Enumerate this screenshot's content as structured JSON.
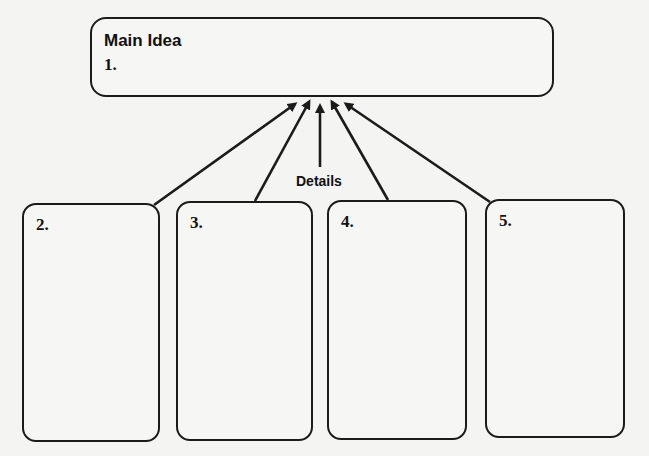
{
  "main_idea": {
    "title": "Main Idea",
    "number": "1."
  },
  "connector_label": "Details",
  "detail_boxes": [
    {
      "number": "2."
    },
    {
      "number": "3."
    },
    {
      "number": "4."
    },
    {
      "number": "5."
    }
  ],
  "colors": {
    "stroke": "#1b1b1b",
    "background": "#f4f4f3"
  }
}
